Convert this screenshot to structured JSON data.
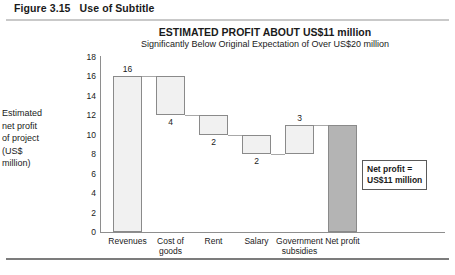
{
  "figure": {
    "caption_number": "Figure 3.15",
    "caption_text": "Use of Subtitle"
  },
  "annotation": {
    "text": "Net profit =\nUS$11 million"
  },
  "colors": {
    "bar_fill": "#f1f1f1",
    "bar_border": "#8a8a8a",
    "final_bar_fill": "#b4b4b4",
    "axis": "#8e8e8e",
    "rule_top": "#c9c9c9",
    "rule_bottom": "#7c7c7c"
  },
  "chart_data": {
    "type": "bar",
    "subtype": "waterfall",
    "title": "ESTIMATED PROFIT ABOUT US$11 million",
    "subtitle": "Significantly Below Original Expectation of Over US$20 million",
    "xlabel": "",
    "ylabel": "Estimated net profit of project (US$ million)",
    "ylabel_lines": [
      "Estimated",
      "net profit",
      "of project",
      "(US$",
      "million)"
    ],
    "ylim": [
      0,
      18
    ],
    "ytick_step": 2,
    "yticks": [
      18,
      16,
      14,
      12,
      10,
      8,
      6,
      4,
      2,
      0
    ],
    "grid": false,
    "legend": "none",
    "categories": [
      "Revenues",
      "Cost of goods",
      "Rent",
      "Salary",
      "Government subsidies",
      "Net profit"
    ],
    "category_label_lines": [
      [
        "Revenues"
      ],
      [
        "Cost of",
        "goods"
      ],
      [
        "Rent"
      ],
      [
        "Salary"
      ],
      [
        "Government",
        "subsidies"
      ],
      [
        "Net profit"
      ]
    ],
    "values": [
      16,
      -4,
      -2,
      -2,
      3,
      11
    ],
    "data_labels": [
      "16",
      "4",
      "2",
      "2",
      "3",
      ""
    ],
    "bars": [
      {
        "category": "Revenues",
        "label": "16",
        "delta": 16,
        "base": 0,
        "top": 16,
        "kind": "total",
        "label_pos": "above"
      },
      {
        "category": "Cost of goods",
        "label": "4",
        "delta": -4,
        "base": 12,
        "top": 16,
        "kind": "decrease",
        "label_pos": "below"
      },
      {
        "category": "Rent",
        "label": "2",
        "delta": -2,
        "base": 10,
        "top": 12,
        "kind": "decrease",
        "label_pos": "below"
      },
      {
        "category": "Salary",
        "label": "2",
        "delta": -2,
        "base": 8,
        "top": 10,
        "kind": "decrease",
        "label_pos": "below"
      },
      {
        "category": "Government subsidies",
        "label": "3",
        "delta": 3,
        "base": 8,
        "top": 11,
        "kind": "increase",
        "label_pos": "above"
      },
      {
        "category": "Net profit",
        "label": "",
        "delta": 11,
        "base": 0,
        "top": 11,
        "kind": "total",
        "label_pos": "none"
      }
    ],
    "annotations": [
      {
        "text": "Net profit = US$11 million",
        "target": "Net profit"
      }
    ]
  }
}
